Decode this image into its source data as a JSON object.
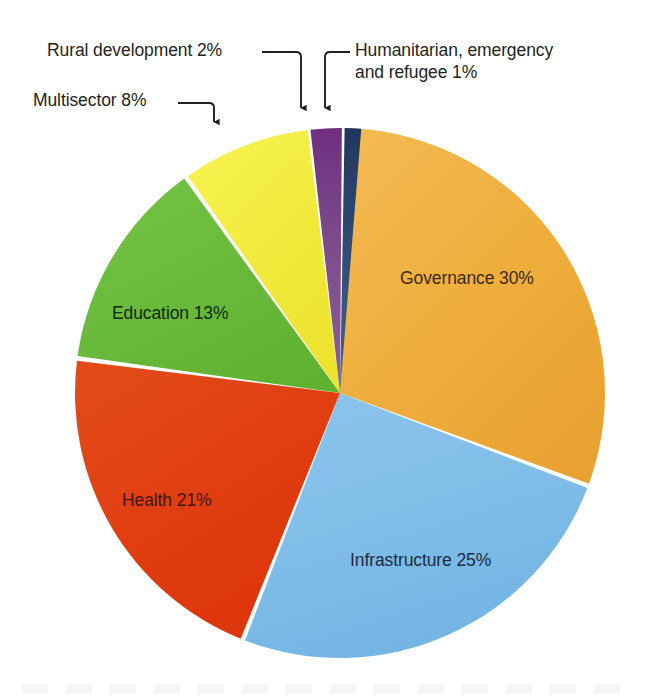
{
  "chart_data": {
    "type": "pie",
    "title": "",
    "subtitle": "",
    "xlabel": "",
    "ylabel": "",
    "legend_position": "none",
    "grid": false,
    "labels_inside_slices": true,
    "total_percent": 100,
    "categories": [
      "Governance",
      "Infrastructure",
      "Health",
      "Education",
      "Multisector",
      "Rural development",
      "Humanitarian, emergency and refugee"
    ],
    "values": [
      30,
      25,
      21,
      13,
      8,
      2,
      1
    ],
    "colors": [
      "#EFAE3C",
      "#7FBDE8",
      "#E03C10",
      "#68B939",
      "#F0E93A",
      "#7B4A8C",
      "#2E4A73"
    ],
    "slices": [
      {
        "name": "Governance",
        "label": "Governance 30%",
        "value": 30,
        "value_text": "30%",
        "color": "#EFAE3C",
        "label_color": "#3a2a10",
        "label_placement": "inside",
        "start_angle_deg": 2,
        "end_angle_deg": 110
      },
      {
        "name": "Infrastructure",
        "label": "Infrastructure 25%",
        "value": 25,
        "value_text": "25%",
        "color": "#7FBDE8",
        "label_color": "#1d2c40",
        "label_placement": "inside",
        "start_angle_deg": 111,
        "end_angle_deg": 201
      },
      {
        "name": "Health",
        "label": "Health 21%",
        "value": 21,
        "value_text": "21%",
        "color": "#E03C10",
        "label_color": "#45150a",
        "label_placement": "inside",
        "start_angle_deg": 202,
        "end_angle_deg": 277
      },
      {
        "name": "Education",
        "label": "Education 13%",
        "value": 13,
        "value_text": "13%",
        "color": "#68B939",
        "label_color": "#10290a",
        "label_placement": "inside",
        "start_angle_deg": 278,
        "end_angle_deg": 324
      },
      {
        "name": "Multisector",
        "label": "Multisector 8%",
        "value": 8,
        "value_text": "8%",
        "color": "#F0E93A",
        "label_color": "#231f20",
        "label_placement": "callout",
        "start_angle_deg": 325,
        "end_angle_deg": 353
      },
      {
        "name": "Rural development",
        "label": "Rural development 2%",
        "value": 2,
        "value_text": "2%",
        "color": "#7B4A8C",
        "label_color": "#231f20",
        "label_placement": "callout",
        "start_angle_deg": 353.6,
        "end_angle_deg": 360.4
      },
      {
        "name": "Humanitarian, emergency and refugee",
        "label": "Humanitarian, emergency and refugee 1%",
        "value": 1,
        "value_text": "1%",
        "color": "#2E4A73",
        "label_color": "#231f20",
        "label_placement": "callout",
        "start_angle_deg": 361,
        "end_angle_deg": 364.6
      }
    ]
  },
  "slice_labels": {
    "governance": "Governance 30%",
    "infrastructure": "Infrastructure 25%",
    "health": "Health 21%",
    "education": "Education 13%"
  },
  "callouts": {
    "rural": "Rural development 2%",
    "multisector": "Multisector 8%",
    "humanitarian_line1": "Humanitarian, emergency",
    "humanitarian_line2": "and refugee 1%",
    "humanitarian_full": "Humanitarian, emergency and refugee 1%"
  },
  "style": {
    "background": "#FFFFFF",
    "leader_line_color": "#231f20",
    "slice_gap_color": "#FFFFFF",
    "text_color": "#231f20"
  }
}
